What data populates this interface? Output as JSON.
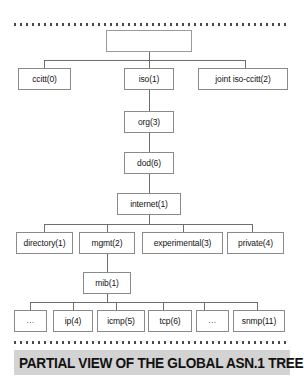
{
  "figure": {
    "caption": "PARTIAL VIEW OF THE GLOBAL ASN.1 TREE",
    "rules": {
      "top": "dotted-rule-top",
      "bottom": "dotted-rule-bottom"
    }
  },
  "tree": {
    "root": {
      "label": "",
      "name": "root-node"
    },
    "level1": [
      {
        "label": "ccitt(0)"
      },
      {
        "label": "iso(1)"
      },
      {
        "label": "joint iso-ccitt(2)"
      }
    ],
    "iso_chain": [
      {
        "label": "org(3)"
      },
      {
        "label": "dod(6)"
      },
      {
        "label": "internet(1)"
      }
    ],
    "internet_children": [
      {
        "label": "directory(1)"
      },
      {
        "label": "mgmt(2)"
      },
      {
        "label": "experimental(3)"
      },
      {
        "label": "private(4)"
      }
    ],
    "mgmt_child": {
      "label": "mib(1)"
    },
    "mib_children": [
      {
        "label": "..."
      },
      {
        "label": "ip(4)"
      },
      {
        "label": "icmp(5)"
      },
      {
        "label": "tcp(6)"
      },
      {
        "label": "..."
      },
      {
        "label": "snmp(11)"
      }
    ]
  },
  "colors": {
    "box_border": "#8a8a8a",
    "box_fill": "#ffffff",
    "connector": "#6e6e6e",
    "caption_band": "#d3d3d3",
    "caption_text": "#111111",
    "dot_rule": "#4a4a4a"
  }
}
